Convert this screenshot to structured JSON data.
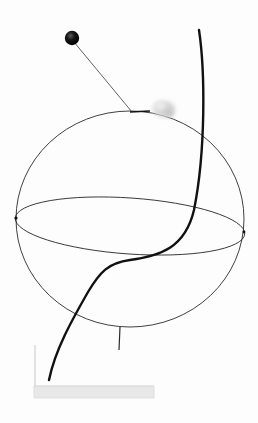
{
  "image": {
    "description": "Wire sculpture: a thin wire sphere with an equatorial ring, a thick S-curved rod, a small black ball on a thin wire, and a fluffy white tuft, mounted on a white base",
    "colors": {
      "background": "#fdfdfd",
      "wire": "#2a2a2a",
      "rod": "#111111",
      "ball": "#0f0f0f",
      "tuft": "#d9d9d9",
      "base_front": "#e6e6e6",
      "base_edge": "#cfcfcf"
    },
    "elements": {
      "sphere": {
        "cx": 130,
        "cy": 219,
        "rx": 114,
        "ry": 108
      },
      "equator": {
        "cx": 130,
        "cy": 226,
        "rx": 115,
        "ry": 28,
        "rotation": 4
      },
      "ball": {
        "cx": 72,
        "cy": 38,
        "r": 7
      },
      "tuft": {
        "cx": 164,
        "cy": 110
      },
      "base": {
        "x": 34,
        "y": 386,
        "width": 120,
        "height": 12
      }
    }
  }
}
